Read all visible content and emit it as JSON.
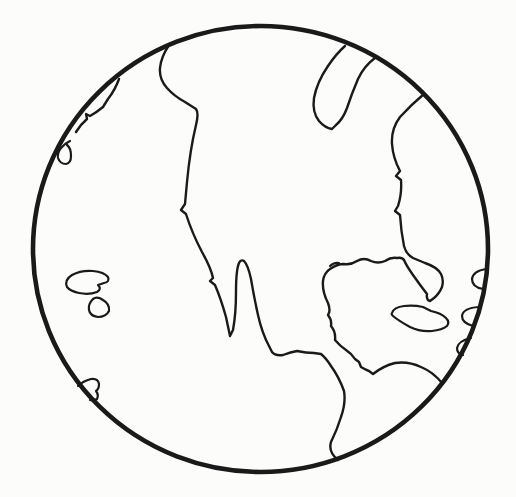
{
  "page": {
    "background_color": "#fcfcfb"
  },
  "figure": {
    "ink_color": "#1a1a1a",
    "globe": {
      "cx": 260.5,
      "cy": 249,
      "rx": 227.5,
      "ry": 223,
      "stroke_width": 4.6
    },
    "coast_stroke_width": 2.4,
    "island_stroke_width": 2.2,
    "shapes": [
      {
        "name": "pacific-coastline",
        "kind": "coast",
        "d": "M 169,45 Q 161,57 160,68 Q 159,79 167,88 Q 174,96 185,102 L 196,109 Q 199,113 196,125 Q 190,150 187,182 L 185,204 L 181,210 L 186,214 Q 192,233 202,252 Q 211,268 213,278 L 210,281 L 215,285 Q 221,299 226,317 L 230,336 L 233,330 Q 236,314 236,292 Q 236,270 239,263 Q 241,259 244,261 Q 248,265 251,279 Q 254,297 258,315 Q 262,333 269,346 L 272,352 Q 275,356 283,355 Q 291,352 297,351 Q 306,353 314,353 L 321,354 Q 326,358 331,366 Q 339,377 344,391 Q 346,403 341,417 Q 337,430 331,442 Q 328,452 338,460"
      },
      {
        "name": "atlantic-gulf-coastline",
        "kind": "coast",
        "d": "M 424,94 Q 412,104 400,117 Q 391,129 392,144 Q 393,158 400,171 L 396,176 L 401,180 Q 402,194 398,206 L 395,211 L 400,215 Q 401,231 404,246 Q 406,254 413,258 L 425,263 Q 437,267 441,274 Q 444,280 442,287 Q 439,294 434,298 L 430,301 Q 426,300 427,294 Q 420,285 413,275 Q 406,265 404,260 Q 402,257 397,258 Q 391,257 385,261 Q 378,264 371,261 Q 364,257 357,261 Q 351,265 344,264 Q 337,264 330,269 Q 324,273 323,281 Q 322,291 328,303 Q 331,311 328,315 Q 332,320 331,326 Q 336,332 335,340 Q 340,346 346,350 Q 352,354 355,359 L 359,362 L 361,367 Q 366,370 369,371 L 373,374 Q 383,366 395,363 Q 408,361 421,367 Q 433,372 442,383"
      },
      {
        "name": "hudson-bay-inlet",
        "kind": "coast",
        "d": "M 345,46 Q 336,54 328,66 Q 317,82 314,98 Q 312,112 319,121 Q 325,128 332,129 L 336,125 Q 343,119 347,108 Q 352,93 358,79 Q 364,66 375,58"
      },
      {
        "name": "rim-peninsula-sliver",
        "kind": "coast",
        "d": "M 119,79 Q 115,90 108,99 L 103,107 Q 97,112 90,116 L 86,114 L 87,119 Q 81,124 76,132"
      },
      {
        "name": "small-island-o",
        "kind": "island",
        "d": "M 70,141 Q 64,144 61,148 Q 57,153 58,158 Q 60,164 66,164 Q 71,163 71,156 Q 71,148 67,145"
      },
      {
        "name": "island-hawaii-large",
        "kind": "island",
        "d": "M 67,287 Q 64,280 72,275 Q 81,270 93,271 Q 104,272 108,277 Q 110,282 104,283 L 98,285 Q 102,289 97,292 Q 89,295 79,293 Q 70,291 67,287 Z"
      },
      {
        "name": "island-hawaii-small",
        "kind": "island",
        "d": "M 93,299 Q 88,304 89,310 Q 90,316 98,317 Q 106,317 109,311 Q 110,304 103,300 Q 97,296 93,299 Z"
      },
      {
        "name": "rim-piece-lower-left",
        "kind": "island",
        "d": "M 78,386 Q 83,381 91,379 Q 98,378 99,384 Q 99,389 96,391 Q 99,395 97,399 Q 94,401 90,400"
      },
      {
        "name": "island-cuba",
        "kind": "island",
        "d": "M 392,313 Q 394,307 404,306 Q 414,305 423,307 L 431,311 Q 441,313 446,318 Q 450,322 447,326 Q 442,330 432,331 Q 420,332 410,327 Q 399,321 393,316 Q 391,314 392,313 Z"
      },
      {
        "name": "rim-bump-right-upper",
        "kind": "island",
        "d": "M 486,269 Q 473,271 472,279 Q 472,287 483,289"
      },
      {
        "name": "rim-bump-right-middle",
        "kind": "island",
        "d": "M 479,307 Q 463,308 462,316 Q 462,323 473,326"
      },
      {
        "name": "rim-bump-right-lower",
        "kind": "island",
        "d": "M 471,338 Q 458,341 457,348 Q 457,354 463,355"
      },
      {
        "name": "gulf-coast-pen-tick",
        "kind": "island",
        "d": "M 330,266 Q 334,262 339,263"
      }
    ]
  }
}
